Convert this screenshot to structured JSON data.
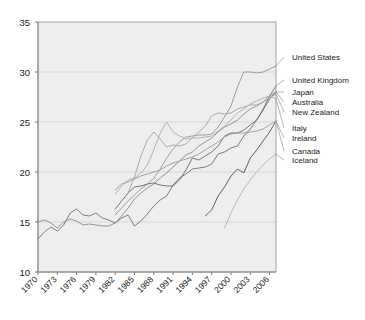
{
  "chart_data": {
    "type": "line",
    "title": "",
    "subtitle": "",
    "xlabel": "",
    "ylabel": "",
    "xlim": [
      1970,
      2007
    ],
    "ylim": [
      10,
      35
    ],
    "grid": true,
    "legend_position": "right-leader-lines",
    "x_ticks": [
      "1970",
      "1973",
      "1976",
      "1979",
      "1982",
      "1985",
      "1988",
      "1991",
      "1994",
      "1997",
      "2000",
      "2003",
      "2006"
    ],
    "y_ticks": [
      "10",
      "15",
      "20",
      "25",
      "30",
      "35"
    ],
    "x": [
      1970,
      1971,
      1972,
      1973,
      1974,
      1975,
      1976,
      1977,
      1978,
      1979,
      1980,
      1981,
      1982,
      1983,
      1984,
      1985,
      1986,
      1987,
      1988,
      1989,
      1990,
      1991,
      1992,
      1993,
      1994,
      1995,
      1996,
      1997,
      1998,
      1999,
      2000,
      2001,
      2002,
      2003,
      2004,
      2005,
      2006,
      2007
    ],
    "series": [
      {
        "name": "United States",
        "color": "#9a9a9a",
        "start_year": 1982,
        "values": [
          null,
          null,
          null,
          null,
          null,
          null,
          null,
          null,
          null,
          null,
          null,
          null,
          15.7,
          16.4,
          17.1,
          17.7,
          18.3,
          18.8,
          19.4,
          20.3,
          21.4,
          22.3,
          23.0,
          23.5,
          23.6,
          23.7,
          23.7,
          23.8,
          24.5,
          25.5,
          26.6,
          28.5,
          30.0,
          30.0,
          29.9,
          30.0,
          30.3,
          30.6
        ]
      },
      {
        "name": "United Kingdom",
        "color": "#777777",
        "start_year": 1970,
        "values": [
          13.3,
          14.0,
          14.5,
          14.1,
          14.7,
          15.9,
          16.3,
          15.7,
          15.6,
          15.9,
          15.4,
          15.2,
          14.9,
          15.4,
          15.7,
          14.6,
          15.1,
          15.8,
          16.6,
          17.2,
          17.6,
          18.7,
          19.4,
          19.8,
          20.3,
          20.4,
          20.5,
          20.8,
          21.8,
          22.0,
          22.4,
          22.6,
          23.6,
          24.3,
          25.2,
          26.3,
          27.6,
          28.6
        ]
      },
      {
        "name": "Japan",
        "color": "#8e8e8e",
        "start_year": 1970,
        "values": [
          15.0,
          15.2,
          14.9,
          14.4,
          15.0,
          15.3,
          15.1,
          14.7,
          14.8,
          14.7,
          14.6,
          14.6,
          14.9,
          15.6,
          16.4,
          17.3,
          17.9,
          18.4,
          18.8,
          19.4,
          19.9,
          20.5,
          21.1,
          21.7,
          22.0,
          22.6,
          23.0,
          23.4,
          24.0,
          24.5,
          24.8,
          25.2,
          25.8,
          26.3,
          26.6,
          27.0,
          27.6,
          28.0
        ]
      },
      {
        "name": "Australia",
        "color": "#6f6f6f",
        "start_year": 1982,
        "values": [
          null,
          null,
          null,
          null,
          null,
          null,
          null,
          null,
          null,
          null,
          null,
          null,
          16.3,
          17.1,
          17.9,
          18.5,
          18.6,
          18.8,
          18.9,
          18.7,
          18.6,
          18.6,
          19.2,
          20.2,
          21.4,
          21.2,
          21.6,
          22.0,
          22.6,
          23.6,
          23.9,
          23.9,
          24.2,
          24.7,
          25.2,
          26.2,
          27.3,
          28.0
        ]
      },
      {
        "name": "New Zealand",
        "color": "#a5a5a5",
        "start_year": 1984,
        "values": [
          null,
          null,
          null,
          null,
          null,
          null,
          null,
          null,
          null,
          null,
          null,
          null,
          null,
          null,
          17.9,
          19.5,
          21.6,
          23.2,
          24.0,
          23.3,
          22.5,
          22.7,
          22.6,
          22.8,
          23.4,
          24.0,
          24.6,
          25.6,
          25.9,
          25.8,
          25.9,
          26.3,
          26.5,
          26.7,
          26.7,
          27.0,
          27.4,
          27.8
        ]
      },
      {
        "name": "Italy",
        "color": "#b0b0b0",
        "start_year": 1982,
        "values": [
          null,
          null,
          null,
          null,
          null,
          null,
          null,
          null,
          null,
          null,
          null,
          null,
          17.8,
          18.6,
          19.2,
          19.4,
          19.9,
          20.7,
          22.2,
          23.9,
          25.0,
          24.0,
          23.6,
          23.3,
          23.4,
          23.4,
          23.5,
          23.6,
          24.1,
          24.6,
          25.2,
          25.9,
          26.3,
          26.8,
          27.1,
          27.4,
          27.6,
          27.3
        ]
      },
      {
        "name": "Ireland",
        "color": "#9e9e9e",
        "start_year": 1982,
        "values": [
          null,
          null,
          null,
          null,
          null,
          null,
          null,
          null,
          null,
          null,
          null,
          null,
          18.2,
          18.8,
          19.0,
          19.3,
          19.6,
          19.8,
          20.0,
          20.2,
          20.6,
          20.9,
          21.1,
          21.3,
          21.5,
          21.8,
          22.2,
          22.6,
          23.0,
          23.5,
          23.8,
          23.9,
          23.9,
          24.0,
          24.1,
          24.3,
          24.7,
          25.1
        ]
      },
      {
        "name": "Canada",
        "color": "#5a5a5a",
        "start_year": 1996,
        "values": [
          null,
          null,
          null,
          null,
          null,
          null,
          null,
          null,
          null,
          null,
          null,
          null,
          null,
          null,
          null,
          null,
          null,
          null,
          null,
          null,
          null,
          null,
          null,
          null,
          null,
          null,
          15.6,
          16.2,
          17.6,
          18.5,
          19.6,
          20.3,
          19.9,
          21.4,
          22.2,
          23.1,
          24.0,
          25.1
        ]
      },
      {
        "name": "Iceland",
        "color": "#b6b6b6",
        "start_year": 1999,
        "values": [
          null,
          null,
          null,
          null,
          null,
          null,
          null,
          null,
          null,
          null,
          null,
          null,
          null,
          null,
          null,
          null,
          null,
          null,
          null,
          null,
          null,
          null,
          null,
          null,
          null,
          null,
          null,
          null,
          null,
          14.4,
          15.9,
          17.2,
          18.3,
          19.2,
          20.0,
          20.7,
          21.3,
          21.8
        ]
      }
    ]
  },
  "legend": {
    "entries": [
      {
        "label": "United States",
        "y": 57
      },
      {
        "label": "United Kingdom",
        "y": 80
      },
      {
        "label": "Japan",
        "y": 92
      },
      {
        "label": "Australia",
        "y": 102
      },
      {
        "label": "New Zealand",
        "y": 112
      },
      {
        "label": "Italy",
        "y": 128
      },
      {
        "label": "Ireland",
        "y": 138
      },
      {
        "label": "Canada",
        "y": 151
      },
      {
        "label": "Iceland",
        "y": 160
      }
    ]
  },
  "axes": {
    "y_title": "",
    "x_title": ""
  }
}
